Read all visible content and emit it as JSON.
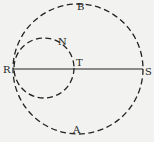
{
  "diagram": {
    "labels": {
      "R": "R",
      "S": "S",
      "T": "T",
      "N": "N",
      "B": "B",
      "A": "A"
    },
    "elements": [
      "large dashed circle through R and S",
      "small dashed circle through R and T",
      "solid line R to S"
    ]
  }
}
